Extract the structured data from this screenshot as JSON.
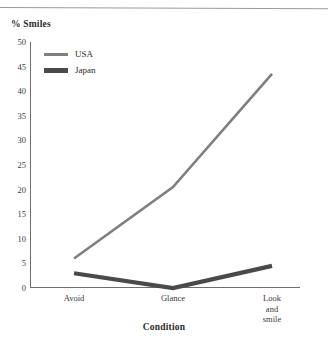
{
  "figure": {
    "y_axis_title": "% Smiles",
    "x_axis_title": "Condition"
  },
  "legend": {
    "items": [
      {
        "label": "USA",
        "color": "#7f7f7f",
        "width": 2.6
      },
      {
        "label": "Japan",
        "color": "#4a4a4a",
        "width": 4.2
      }
    ]
  },
  "chart_data": {
    "type": "line",
    "title": "",
    "subtitle": "",
    "xlabel": "Condition",
    "ylabel": "% Smiles",
    "categories": [
      "Avoid",
      "Glance",
      "Look and\nsmile"
    ],
    "series": [
      {
        "name": "USA",
        "values": [
          6,
          20.5,
          43.5
        ],
        "color": "#7f7f7f",
        "line_width": 2.6
      },
      {
        "name": "Japan",
        "values": [
          3,
          0,
          4.5
        ],
        "color": "#4a4a4a",
        "line_width": 4.2
      }
    ],
    "ylim": [
      0,
      50
    ],
    "yticks": [
      0,
      5,
      10,
      15,
      20,
      25,
      30,
      35,
      40,
      45,
      50
    ],
    "ytick_labels": [
      "0",
      "5",
      "10",
      "15",
      "20",
      "25",
      "30",
      "35",
      "40",
      "45",
      "50"
    ],
    "grid": false,
    "markers": false,
    "legend_position": "upper left"
  }
}
